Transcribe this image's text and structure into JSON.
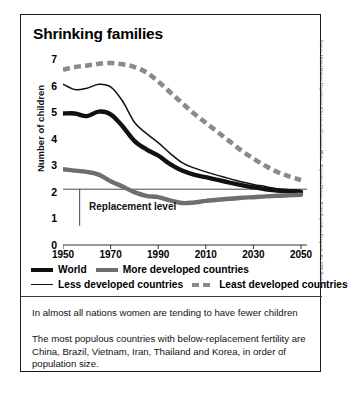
{
  "title": "Shrinking families",
  "source": "Source: United Nations Department of Social and Economic Affairs - Population Division, World Population Prospects: the 2006 Revision",
  "captions": {
    "line1": "In almost all nations women are tending to have fewer children",
    "line2": "The most populous countries with below-replacement fertility are China, Brazil, Vietnam, Iran, Thailand and Korea, in order of population size."
  },
  "annotation": {
    "replacement_level": "Replacement level"
  },
  "legend": [
    {
      "label": "World",
      "key": "world",
      "style": "thick-black"
    },
    {
      "label": "More developed countries",
      "key": "more",
      "style": "thick-gray"
    },
    {
      "label": "Less developed countries",
      "key": "less",
      "style": "thin-black"
    },
    {
      "label": "Least developed countries",
      "key": "least",
      "style": "dashed-gray"
    }
  ],
  "colors": {
    "world": "#111111",
    "more_developed": "#6e6e6e",
    "less_developed": "#111111",
    "least_developed": "#8a8a8a",
    "axis": "#333333",
    "frame": "#1a1a1a"
  },
  "chart_data": {
    "type": "line",
    "title": "Shrinking families",
    "xlabel": "",
    "ylabel": "Number of children",
    "xlim": [
      1950,
      2050
    ],
    "ylim": [
      0,
      7
    ],
    "xticks": [
      1950,
      1970,
      1990,
      2010,
      2030,
      2050
    ],
    "yticks": [
      0,
      1,
      2,
      3,
      4,
      5,
      6,
      7
    ],
    "grid": false,
    "legend_position": "below-plot",
    "annotations": [
      {
        "text": "Replacement level",
        "y_value": 2.1,
        "type": "hline-label"
      }
    ],
    "x": [
      1950,
      1955,
      1960,
      1965,
      1970,
      1975,
      1980,
      1985,
      1990,
      1995,
      2000,
      2005,
      2010,
      2015,
      2020,
      2025,
      2030,
      2035,
      2040,
      2045,
      2050
    ],
    "series": [
      {
        "name": "World",
        "values": [
          4.95,
          4.95,
          4.85,
          5.02,
          4.92,
          4.47,
          3.92,
          3.6,
          3.37,
          3.04,
          2.8,
          2.65,
          2.55,
          2.45,
          2.35,
          2.25,
          2.17,
          2.1,
          2.05,
          2.02,
          2.0
        ]
      },
      {
        "name": "More developed countries",
        "values": [
          2.85,
          2.8,
          2.75,
          2.65,
          2.4,
          2.2,
          1.99,
          1.85,
          1.8,
          1.68,
          1.58,
          1.6,
          1.66,
          1.7,
          1.74,
          1.78,
          1.8,
          1.83,
          1.85,
          1.87,
          1.89
        ]
      },
      {
        "name": "Less developed countries",
        "values": [
          6.05,
          5.85,
          5.9,
          6.05,
          5.95,
          5.42,
          4.62,
          4.2,
          3.85,
          3.45,
          3.1,
          2.9,
          2.75,
          2.62,
          2.5,
          2.38,
          2.28,
          2.2,
          2.12,
          2.08,
          2.05
        ]
      },
      {
        "name": "Least developed countries",
        "values": [
          6.6,
          6.7,
          6.75,
          6.82,
          6.85,
          6.8,
          6.7,
          6.5,
          6.15,
          5.75,
          5.35,
          4.95,
          4.6,
          4.25,
          3.9,
          3.55,
          3.25,
          2.98,
          2.75,
          2.58,
          2.45
        ]
      }
    ]
  }
}
